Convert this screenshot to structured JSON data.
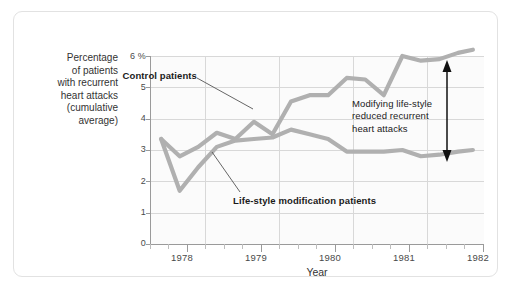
{
  "chart_data": {
    "type": "line",
    "title": "",
    "xlabel": "Year",
    "ylabel": "Percentage of patients with recurrent heart attacks (cumulative average)",
    "ylabel_lines": [
      "Percentage",
      "of patients",
      "with recurrent",
      "heart attacks",
      "(cumulative",
      "average)"
    ],
    "xlim": [
      1977.75,
      1982.25
    ],
    "ylim": [
      0,
      6.4
    ],
    "yticks": [
      0,
      1,
      2,
      3,
      4,
      5,
      6
    ],
    "ytick_labels": [
      "0",
      "1",
      "2",
      "3",
      "4",
      "5",
      "6 %"
    ],
    "xticks": [
      1978,
      1979,
      1980,
      1981,
      1982
    ],
    "xtick_labels": [
      "1978",
      "1979",
      "1980",
      "1981",
      "1982"
    ],
    "minor_xticks_per_year": 4,
    "grid": "both",
    "legend_position": "inline-annotations",
    "line_color": "#b0b0b0",
    "series": [
      {
        "name": "Control patients",
        "color": "#b0b0b0",
        "x": [
          1977.9,
          1978.15,
          1978.4,
          1978.65,
          1978.9,
          1979.15,
          1979.4,
          1979.65,
          1979.9,
          1980.15,
          1980.4,
          1980.65,
          1980.9,
          1981.15,
          1981.4,
          1981.65,
          1981.9,
          1982.1
        ],
        "values": [
          3.35,
          2.8,
          3.1,
          3.55,
          3.35,
          3.9,
          3.5,
          4.55,
          4.75,
          4.75,
          5.3,
          5.25,
          4.75,
          6.0,
          5.85,
          5.9,
          6.1,
          6.2
        ]
      },
      {
        "name": "Life-style modification patients",
        "color": "#b0b0b0",
        "x": [
          1977.9,
          1978.15,
          1978.4,
          1978.65,
          1978.9,
          1979.15,
          1979.4,
          1979.65,
          1979.9,
          1980.15,
          1980.4,
          1980.65,
          1980.9,
          1981.15,
          1981.4,
          1981.65,
          1981.9,
          1982.1
        ],
        "values": [
          3.35,
          1.7,
          2.45,
          3.1,
          3.3,
          3.35,
          3.4,
          3.65,
          3.5,
          3.35,
          2.95,
          2.95,
          2.95,
          3.0,
          2.8,
          2.85,
          2.95,
          3.0
        ]
      }
    ],
    "annotations": [
      {
        "id": "control-label",
        "text": "Control patients",
        "style": "bold",
        "has_leader_line": true
      },
      {
        "id": "lifestyle-label",
        "text": "Life-style modification patients",
        "style": "bold",
        "has_leader_line": true
      },
      {
        "id": "effect-callout",
        "lines": [
          "Modifying life-style",
          "reduced recurrent",
          "heart attacks"
        ],
        "style": "plain",
        "has_double_arrow": true,
        "arrow_from": 6.2,
        "arrow_to": 3.0
      }
    ]
  },
  "axis_titles": {
    "x": "Year"
  }
}
